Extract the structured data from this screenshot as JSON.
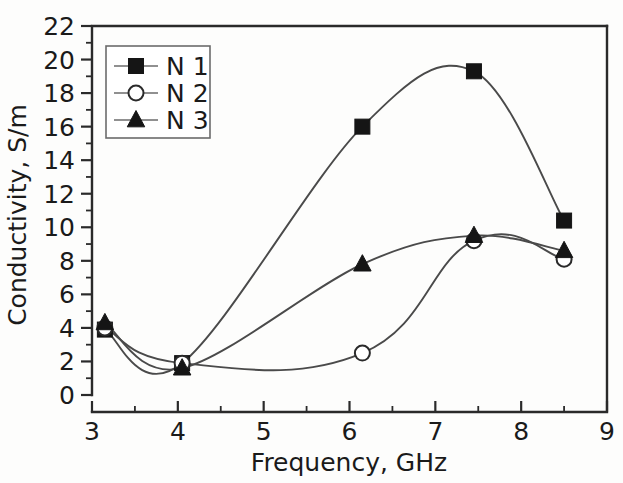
{
  "chart_data": {
    "type": "line",
    "title": "",
    "xlabel": "Frequency, GHz",
    "ylabel": "Conductivity, S/m",
    "xlim": [
      3,
      9
    ],
    "ylim": [
      0,
      22
    ],
    "xticks": [
      3,
      4,
      5,
      6,
      7,
      8,
      9
    ],
    "xtick_labels": [
      "3",
      "4",
      "5",
      "6",
      "7",
      "8",
      "9"
    ],
    "yticks": [
      0,
      2,
      4,
      6,
      8,
      10,
      12,
      14,
      16,
      18,
      20,
      22
    ],
    "ytick_labels": [
      "0",
      "2",
      "4",
      "6",
      "8",
      "10",
      "12",
      "14",
      "16",
      "18",
      "20",
      "22"
    ],
    "x_minor_step": 0.5,
    "y_minor_step": 1,
    "grid": false,
    "legend_position": "upper left",
    "smoothing": "spline",
    "series": [
      {
        "name": "N 1",
        "marker": "filled-square",
        "x": [
          3.15,
          4.05,
          6.15,
          7.45,
          8.5
        ],
        "values": [
          3.9,
          1.9,
          16.0,
          19.3,
          10.4
        ]
      },
      {
        "name": "N 2",
        "marker": "open-circle",
        "x": [
          3.15,
          4.05,
          6.15,
          7.45,
          8.5
        ],
        "values": [
          4.0,
          1.9,
          2.5,
          9.2,
          8.1
        ]
      },
      {
        "name": "N 3",
        "marker": "filled-triangle",
        "x": [
          3.15,
          4.05,
          6.15,
          7.45,
          8.5
        ],
        "values": [
          4.3,
          1.6,
          7.8,
          9.5,
          8.6
        ]
      }
    ],
    "annotations": []
  },
  "colors": {
    "axis": "#2a2a2a",
    "line": "#4a4a4a",
    "marker_fill": "#151515",
    "marker_open_fill": "#ffffff",
    "text": "#1a1a1a",
    "background": "#fdfdfc",
    "legend_border": "#6b6b6b"
  }
}
